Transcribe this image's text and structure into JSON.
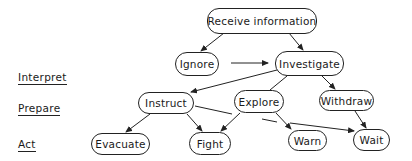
{
  "diagram": {
    "stages": [
      {
        "id": "interpret",
        "label": "Interpret"
      },
      {
        "id": "prepare",
        "label": "Prepare"
      },
      {
        "id": "act",
        "label": "Act"
      }
    ],
    "nodes": {
      "receive": {
        "label": "Receive information"
      },
      "ignore": {
        "label": "Ignore"
      },
      "investigate": {
        "label": "Investigate"
      },
      "instruct": {
        "label": "Instruct"
      },
      "explore": {
        "label": "Explore"
      },
      "withdraw": {
        "label": "Withdraw"
      },
      "evacuate": {
        "label": "Evacuate"
      },
      "fight": {
        "label": "Fight"
      },
      "warn": {
        "label": "Warn"
      },
      "wait": {
        "label": "Wait"
      }
    },
    "edges": [
      {
        "from": "receive",
        "to": "ignore"
      },
      {
        "from": "receive",
        "to": "investigate"
      },
      {
        "from": "ignore",
        "to": "investigate"
      },
      {
        "from": "investigate",
        "to": "instruct"
      },
      {
        "from": "investigate",
        "to": "explore"
      },
      {
        "from": "investigate",
        "to": "withdraw"
      },
      {
        "from": "instruct",
        "to": "evacuate"
      },
      {
        "from": "instruct",
        "to": "fight"
      },
      {
        "from": "instruct",
        "to": "wait"
      },
      {
        "from": "explore",
        "to": "fight"
      },
      {
        "from": "explore",
        "to": "warn"
      },
      {
        "from": "withdraw",
        "to": "wait"
      }
    ],
    "colors": {
      "line": "#222222",
      "background": "#ffffff"
    }
  }
}
